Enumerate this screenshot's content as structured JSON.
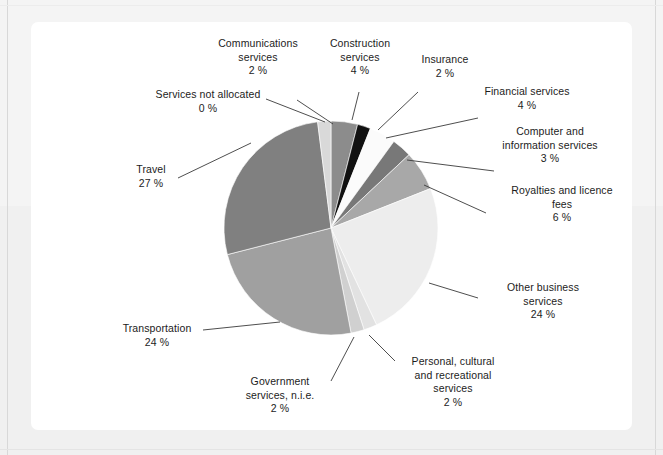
{
  "figure": {
    "background_color": "#f2f2f2",
    "panel_color": "#ffffff",
    "text_color": "#1c1c1c"
  },
  "chart_data": {
    "type": "pie",
    "title": "",
    "subtitle": "",
    "xlabel": "",
    "ylabel": "",
    "legend_position": "none",
    "grid": false,
    "value_suffix": "%",
    "start_angle_deg": 0,
    "direction": "clockwise",
    "categories": [
      "Construction services",
      "Insurance",
      "Financial services",
      "Computer and information services",
      "Royalties and licence fees",
      "Other business services",
      "Personal, cultural and recreational services",
      "Government services, n.i.e.",
      "Transportation",
      "Travel",
      "Communications services",
      "Services not allocated"
    ],
    "values": [
      4,
      2,
      4,
      3,
      6,
      24,
      2,
      2,
      24,
      27,
      2,
      0
    ],
    "colors": [
      "#8c8c8c",
      "#111111",
      "#fbfbfb",
      "#787878",
      "#a8a8a8",
      "#ededed",
      "#e2e2e2",
      "#d0d0d0",
      "#a0a0a0",
      "#808080",
      "#d9d9d9",
      "#f5f5f5"
    ],
    "slices": [
      {
        "label": "Construction services",
        "value": 4,
        "value_text": "4 %",
        "color": "#8c8c8c"
      },
      {
        "label": "Insurance",
        "value": 2,
        "value_text": "2 %",
        "color": "#111111"
      },
      {
        "label": "Financial services",
        "value": 4,
        "value_text": "4 %",
        "color": "#fbfbfb"
      },
      {
        "label": "Computer and information services",
        "value": 3,
        "value_text": "3 %",
        "color": "#787878"
      },
      {
        "label": "Royalties and licence fees",
        "value": 6,
        "value_text": "6 %",
        "color": "#a8a8a8"
      },
      {
        "label": "Other business services",
        "value": 24,
        "value_text": "24 %",
        "color": "#ededed"
      },
      {
        "label": "Personal, cultural and recreational services",
        "value": 2,
        "value_text": "2 %",
        "color": "#e2e2e2"
      },
      {
        "label": "Government services, n.i.e.",
        "value": 2,
        "value_text": "2 %",
        "color": "#d0d0d0"
      },
      {
        "label": "Transportation",
        "value": 24,
        "value_text": "24 %",
        "color": "#a0a0a0"
      },
      {
        "label": "Travel",
        "value": 27,
        "value_text": "27 %",
        "color": "#808080"
      },
      {
        "label": "Communications services",
        "value": 2,
        "value_text": "2 %",
        "color": "#d9d9d9"
      },
      {
        "label": "Services not allocated",
        "value": 0,
        "value_text": "0 %",
        "color": "#f5f5f5"
      }
    ]
  },
  "labels": {
    "communications_services": "Communications\nservices\n2 %",
    "construction_services": "Construction\nservices\n4 %",
    "insurance": "Insurance\n2 %",
    "financial_services": "Financial services\n4 %",
    "computer_information_services": "Computer and\ninformation services\n3 %",
    "royalties_licence_fees": "Royalties and licence\nfees\n6 %",
    "other_business_services": "Other business\nservices\n24 %",
    "personal_cultural_recreational": "Personal, cultural\nand recreational\nservices\n2 %",
    "government_services": "Government\nservices, n.i.e.\n2 %",
    "transportation": "Transportation\n24 %",
    "travel": "Travel\n27 %",
    "services_not_allocated": "Services not allocated\n0 %"
  }
}
